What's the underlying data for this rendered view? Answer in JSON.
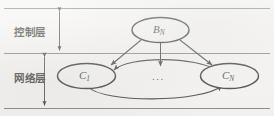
{
  "figure": {
    "kind": "layered-architecture-diagram",
    "background_color": "#f3f2f0",
    "line_color": "#1a1a1a",
    "rule_color": "#555555"
  },
  "layers": [
    {
      "id": "control",
      "label": "控制层",
      "label_en": "Control layer"
    },
    {
      "id": "network",
      "label": "网络层",
      "label_en": "Network layer"
    }
  ],
  "nodes": [
    {
      "id": "bn",
      "base": "B",
      "sub": "N",
      "layer": "control"
    },
    {
      "id": "c1",
      "base": "C",
      "sub": "1",
      "layer": "network"
    },
    {
      "id": "cn",
      "base": "C",
      "sub": "N",
      "layer": "network"
    }
  ],
  "ellipsis": "...",
  "edges": [
    {
      "id": "bn-c1",
      "from": "bn",
      "to": "c1",
      "style": "double-arrow"
    },
    {
      "id": "bn-cn",
      "from": "bn",
      "to": "cn",
      "style": "double-arrow"
    },
    {
      "id": "bn-mid",
      "from": "bn",
      "to": "ellipsis",
      "style": "double-arrow"
    },
    {
      "id": "cn-c1-top",
      "from": "cn",
      "to": "c1",
      "style": "curve-arrow"
    },
    {
      "id": "c1-cn-bottom",
      "from": "c1",
      "to": "cn",
      "style": "curve-arrow"
    }
  ],
  "dimension_lines": [
    {
      "id": "control-extent",
      "layer": "control",
      "style": "double-headed-vertical"
    },
    {
      "id": "network-extent",
      "layer": "network",
      "style": "double-headed-vertical"
    }
  ]
}
